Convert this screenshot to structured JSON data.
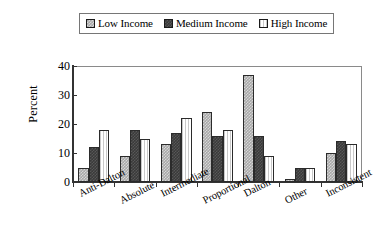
{
  "chart_data": {
    "type": "bar",
    "title": "",
    "subtitle": "",
    "xlabel": "",
    "ylabel": "Percent",
    "ylim": [
      0,
      40
    ],
    "yticks": [
      0,
      10,
      20,
      30,
      40
    ],
    "grid": false,
    "legend_position": "top-center",
    "categories": [
      "Anti-Dalton",
      "Absolute",
      "Intermediate",
      "Proportional",
      "Dalton",
      "Other",
      "Inconsistent"
    ],
    "series": [
      {
        "name": "Low Income",
        "swatch": "hatched-gray",
        "color": "#a8a8a8",
        "values": [
          5,
          9,
          13,
          24,
          37,
          1,
          10
        ]
      },
      {
        "name": "Medium Income",
        "swatch": "dark-gray",
        "color": "#3a3a3a",
        "values": [
          12,
          18,
          17,
          16,
          16,
          5,
          14
        ]
      },
      {
        "name": "High Income",
        "swatch": "white-vertical-lines",
        "color": "#ffffff",
        "values": [
          18,
          15,
          22,
          18,
          9,
          5,
          13
        ]
      }
    ]
  },
  "legend": {
    "entries": [
      {
        "label": "Low Income"
      },
      {
        "label": "Medium Income"
      },
      {
        "label": "High Income"
      }
    ]
  },
  "axes": {
    "y_axis_title": "Percent",
    "y_tick_labels": [
      "40",
      "30",
      "20",
      "10",
      "0"
    ],
    "x_tick_labels": [
      "Anti-Dalton",
      "Absolute",
      "Intermediate",
      "Proportional",
      "Dalton",
      "Other",
      "Inconsistent"
    ]
  },
  "colors": {
    "low_income": "#a8a8a8",
    "medium_income": "#3a3a3a",
    "high_income": "#ffffff",
    "axis": "#333333",
    "frame": "#8a8a8a",
    "text": "#000000"
  }
}
